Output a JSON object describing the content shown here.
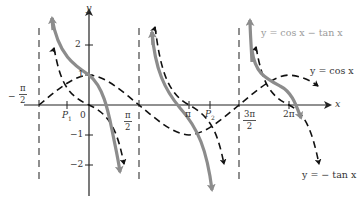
{
  "figure": {
    "axes": {
      "x_label": "x",
      "y_label": "y",
      "y_ticks": [
        {
          "value": 2,
          "label": "2"
        },
        {
          "value": 1,
          "label": "1"
        },
        {
          "value": -1,
          "label": "−1"
        },
        {
          "value": -2,
          "label": "−2"
        }
      ],
      "x_ticks": {
        "neg_pi_half": {
          "sign": "−",
          "num": "π",
          "den": "2"
        },
        "p1": {
          "label": "P",
          "sub": "1"
        },
        "zero": "0",
        "pi_half": {
          "num": "π",
          "den": "2"
        },
        "pi": "π",
        "p2": {
          "label": "P",
          "sub": "2"
        },
        "three_pi_half": {
          "num": "3π",
          "den": "2"
        },
        "two_pi": "2π"
      }
    },
    "legend": {
      "sum_curve": "y = cos x − tan x",
      "cos_curve": "y = cos x",
      "neg_tan_curve": "y = − tan x"
    },
    "colors": {
      "sum_curve": "#8c8c8c",
      "component_curves": "#111111",
      "axes": "#222222",
      "asymptotes": "#333333",
      "sum_label": "#9a9a9a",
      "text": "#333333"
    }
  }
}
